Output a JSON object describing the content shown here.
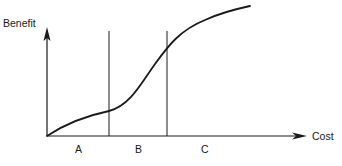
{
  "diagram": {
    "y_axis_label": "Benefit",
    "x_axis_label": "Cost",
    "regions": [
      {
        "label": "A"
      },
      {
        "label": "B"
      },
      {
        "label": "C"
      }
    ],
    "curve_description": "S-shaped benefit vs cost curve: slow gain in A, steep rise in B, diminishing returns in C",
    "colors": {
      "line": "#1a1a1a",
      "background": "#ffffff"
    }
  }
}
